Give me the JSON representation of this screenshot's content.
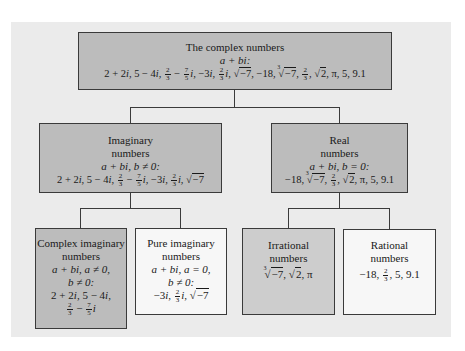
{
  "diagram": {
    "colors": {
      "panel_background": "#ebebeb",
      "dark_box": "#bcbcbc",
      "mid_box": "#cdcdcd",
      "light_box": "#f7f7f7",
      "border": "#3a3a3a"
    },
    "nodes": {
      "complex": {
        "label_line1": "The complex numbers",
        "form": "a + bi:",
        "examples": "2 + 2i, 5 − 4i, 2/3 − 7/5 i, −3i, 2/3 i, √−7, −18, ∛−7, 2/3, √2, π, 5, 9.1"
      },
      "imaginary": {
        "label_line1": "Imaginary",
        "label_line2": "numbers",
        "form": "a + bi, b ≠ 0:",
        "examples": "2 + 2i, 5 − 4i, 2/3 − 7/5 i, −3i, 2/3 i, √−7"
      },
      "real": {
        "label_line1": "Real",
        "label_line2": "numbers",
        "form": "a + bi, b = 0:",
        "examples": "−18, ∛−7, 2/3, √2, π, 5, 9.1"
      },
      "complex_imaginary": {
        "label_line1": "Complex imaginary",
        "label_line2": "numbers",
        "form_line1": "a + bi, a ≠ 0,",
        "form_line2": "b ≠ 0:",
        "examples_line1": "2 + 2i, 5 − 4i,",
        "examples_line2": "2/3 − 7/5 i"
      },
      "pure_imaginary": {
        "label_line1": "Pure imaginary",
        "label_line2": "numbers",
        "form_line1": "a + bi, a = 0,",
        "form_line2": "b ≠ 0:",
        "examples": "−3i, 2/3 i, √−7"
      },
      "irrational": {
        "label_line1": "Irrational",
        "label_line2": "numbers",
        "examples": "∛−7, √2, π"
      },
      "rational": {
        "label_line1": "Rational",
        "label_line2": "numbers",
        "examples": "−18, 2/3, 5, 9.1"
      }
    },
    "edges": [
      [
        "complex",
        "imaginary"
      ],
      [
        "complex",
        "real"
      ],
      [
        "imaginary",
        "complex_imaginary"
      ],
      [
        "imaginary",
        "pure_imaginary"
      ],
      [
        "real",
        "irrational"
      ],
      [
        "real",
        "rational"
      ]
    ]
  }
}
